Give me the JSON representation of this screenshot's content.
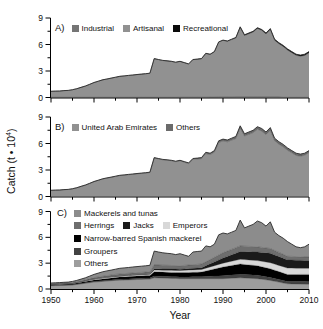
{
  "ui": {
    "ylabel": {
      "prefix": "Catch (t • 10",
      "sup": "4",
      "suffix": ")"
    },
    "xlabel": "Year",
    "panels": {
      "a": {
        "letter": "A)",
        "legend_rows": [
          [
            {
              "label": "Industrial",
              "color": "#757575"
            },
            {
              "label": "Artisanal",
              "color": "#919191"
            },
            {
              "label": "Recreational",
              "color": "#0a0a0a"
            }
          ]
        ]
      },
      "b": {
        "letter": "B)",
        "legend_rows": [
          [
            {
              "label": "United Arab Emirates",
              "color": "#919191"
            },
            {
              "label": "Others",
              "color": "#6b6b6b"
            }
          ]
        ]
      },
      "c": {
        "letter": "C)",
        "legend_rows": [
          [
            {
              "label": "Mackerels and tunas",
              "color": "#8c8c8c"
            }
          ],
          [
            {
              "label": "Herrings",
              "color": "#6e6e6e"
            },
            {
              "label": "Jacks",
              "color": "#1a1a1a"
            },
            {
              "label": "Emperors",
              "color": "#d8d8d8"
            }
          ],
          [
            {
              "label": "Narrow-barred Spanish mackerel",
              "color": "#000000"
            }
          ],
          [
            {
              "label": "Groupers",
              "color": "#424242"
            }
          ],
          [
            {
              "label": "Others",
              "color": "#9d9d9d"
            }
          ]
        ]
      }
    }
  },
  "chart_data": {
    "type": "area",
    "xlabel": "Year",
    "ylabel": "Catch (t • 10^4)",
    "xlim": [
      1950,
      2010
    ],
    "ylim": [
      0,
      9
    ],
    "y_ticks": [
      0,
      3,
      6,
      9
    ],
    "y_minor_ticks": [
      1.5,
      4.5,
      7.5
    ],
    "x_ticks": [
      1950,
      1960,
      1970,
      1980,
      1990,
      2000,
      2010
    ],
    "x_minor_ticks": [
      1955,
      1965,
      1975,
      1985,
      1995,
      2005
    ],
    "year_start": 1950,
    "totals": [
      0.7,
      0.72,
      0.74,
      0.78,
      0.8,
      0.88,
      1.0,
      1.15,
      1.3,
      1.5,
      1.7,
      1.85,
      2.0,
      2.1,
      2.2,
      2.3,
      2.4,
      2.45,
      2.5,
      2.55,
      2.6,
      2.65,
      2.7,
      2.75,
      4.4,
      4.3,
      4.2,
      4.15,
      4.1,
      4.0,
      4.1,
      3.95,
      3.8,
      4.3,
      4.35,
      4.4,
      5.0,
      4.9,
      5.2,
      6.3,
      6.5,
      6.4,
      6.6,
      6.8,
      8.0,
      7.1,
      7.3,
      7.5,
      7.9,
      7.7,
      7.3,
      7.8,
      6.6,
      6.2,
      5.9,
      5.5,
      5.2,
      4.9,
      4.8,
      4.9,
      5.2
    ],
    "panels": [
      {
        "id": "a",
        "stack_note": "series listed bottom to top",
        "series": [
          {
            "name": "Industrial",
            "color": "#757575",
            "anchors": [
              [
                1950,
                0.02
              ],
              [
                1985,
                0.03
              ],
              [
                1990,
                0.06
              ],
              [
                2010,
                0.08
              ]
            ]
          },
          {
            "name": "Artisanal",
            "color": "#919191",
            "derived": "total_minus_siblings"
          },
          {
            "name": "Recreational",
            "color": "#0a0a0a",
            "anchors": [
              [
                1950,
                0.0
              ],
              [
                1989,
                0.02
              ],
              [
                1995,
                0.08
              ],
              [
                2010,
                0.14
              ]
            ]
          }
        ]
      },
      {
        "id": "b",
        "stack_note": "series listed bottom to top",
        "series": [
          {
            "name": "United Arab Emirates",
            "color": "#919191",
            "derived": "total_minus_siblings"
          },
          {
            "name": "Others",
            "color": "#6b6b6b",
            "anchors": [
              [
                1950,
                0.0
              ],
              [
                1980,
                0.05
              ],
              [
                1990,
                0.2
              ],
              [
                2000,
                0.3
              ],
              [
                2010,
                0.22
              ]
            ]
          }
        ]
      },
      {
        "id": "c",
        "stack_note": "series listed bottom to top",
        "series": [
          {
            "name": "Others",
            "color": "#9d9d9d",
            "anchors": [
              [
                1950,
                0.38
              ],
              [
                1955,
                0.45
              ],
              [
                1960,
                0.8
              ],
              [
                1965,
                1.0
              ],
              [
                1970,
                1.1
              ],
              [
                1973,
                1.15
              ],
              [
                1974,
                1.3
              ],
              [
                1980,
                1.2
              ],
              [
                1985,
                1.2
              ],
              [
                1990,
                1.2
              ],
              [
                1994,
                1.3
              ],
              [
                1998,
                1.2
              ],
              [
                2001,
                1.0
              ],
              [
                2005,
                0.6
              ],
              [
                2010,
                0.55
              ]
            ]
          },
          {
            "name": "Groupers",
            "color": "#424242",
            "anchors": [
              [
                1950,
                0.04
              ],
              [
                1955,
                0.05
              ],
              [
                1960,
                0.08
              ],
              [
                1965,
                0.1
              ],
              [
                1970,
                0.12
              ],
              [
                1973,
                0.13
              ],
              [
                1974,
                0.2
              ],
              [
                1980,
                0.2
              ],
              [
                1985,
                0.22
              ],
              [
                1990,
                0.35
              ],
              [
                1994,
                0.4
              ],
              [
                1998,
                0.4
              ],
              [
                2001,
                0.35
              ],
              [
                2005,
                0.28
              ],
              [
                2010,
                0.3
              ]
            ]
          },
          {
            "name": "Narrow-barred Spanish mackerel",
            "color": "#000000",
            "anchors": [
              [
                1950,
                0.08
              ],
              [
                1955,
                0.1
              ],
              [
                1960,
                0.18
              ],
              [
                1965,
                0.25
              ],
              [
                1970,
                0.28
              ],
              [
                1973,
                0.3
              ],
              [
                1974,
                0.5
              ],
              [
                1980,
                0.5
              ],
              [
                1985,
                0.55
              ],
              [
                1990,
                1.0
              ],
              [
                1994,
                1.2
              ],
              [
                1998,
                1.1
              ],
              [
                2001,
                1.0
              ],
              [
                2005,
                0.8
              ],
              [
                2010,
                0.85
              ]
            ]
          },
          {
            "name": "Emperors",
            "color": "#d8d8d8",
            "anchors": [
              [
                1950,
                0.03
              ],
              [
                1955,
                0.04
              ],
              [
                1960,
                0.08
              ],
              [
                1965,
                0.1
              ],
              [
                1970,
                0.12
              ],
              [
                1973,
                0.13
              ],
              [
                1974,
                0.2
              ],
              [
                1980,
                0.25
              ],
              [
                1985,
                0.3
              ],
              [
                1990,
                0.45
              ],
              [
                1994,
                0.55
              ],
              [
                1998,
                0.6
              ],
              [
                2001,
                0.7
              ],
              [
                2005,
                0.75
              ],
              [
                2010,
                0.7
              ]
            ]
          },
          {
            "name": "Jacks",
            "color": "#1a1a1a",
            "anchors": [
              [
                1950,
                0.01
              ],
              [
                1955,
                0.01
              ],
              [
                1960,
                0.03
              ],
              [
                1965,
                0.05
              ],
              [
                1970,
                0.06
              ],
              [
                1973,
                0.06
              ],
              [
                1974,
                0.15
              ],
              [
                1980,
                0.15
              ],
              [
                1985,
                0.2
              ],
              [
                1990,
                0.6
              ],
              [
                1994,
                0.9
              ],
              [
                1998,
                1.0
              ],
              [
                2001,
                1.1
              ],
              [
                2005,
                0.95
              ],
              [
                2010,
                0.9
              ]
            ]
          },
          {
            "name": "Herrings",
            "color": "#6e6e6e",
            "anchors": [
              [
                1950,
                0.06
              ],
              [
                1955,
                0.08
              ],
              [
                1960,
                0.15
              ],
              [
                1965,
                0.2
              ],
              [
                1970,
                0.22
              ],
              [
                1973,
                0.23
              ],
              [
                1974,
                0.45
              ],
              [
                1980,
                0.4
              ],
              [
                1985,
                0.43
              ],
              [
                1990,
                0.6
              ],
              [
                1994,
                0.65
              ],
              [
                1998,
                0.6
              ],
              [
                2001,
                0.55
              ],
              [
                2005,
                0.42
              ],
              [
                2010,
                0.4
              ]
            ]
          },
          {
            "name": "Mackerels and tunas",
            "color": "#8c8c8c",
            "absorbs_residual": true,
            "anchors": [
              [
                1950,
                0.1
              ],
              [
                1955,
                0.15
              ],
              [
                1960,
                0.38
              ],
              [
                1965,
                0.6
              ],
              [
                1970,
                0.7
              ],
              [
                1973,
                0.75
              ],
              [
                1974,
                1.6
              ],
              [
                1980,
                1.4
              ],
              [
                1985,
                1.5
              ],
              [
                1990,
                2.3
              ],
              [
                1994,
                3.0
              ],
              [
                1998,
                3.0
              ],
              [
                2001,
                3.1
              ],
              [
                2005,
                1.7
              ],
              [
                2010,
                1.5
              ]
            ]
          }
        ]
      }
    ]
  }
}
